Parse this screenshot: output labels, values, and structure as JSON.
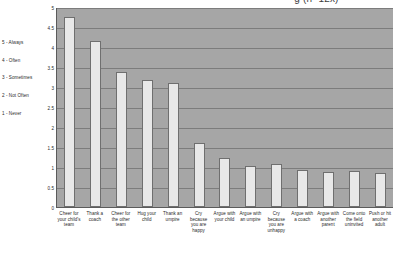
{
  "chart_data": {
    "type": "bar",
    "title": "g (n=12x)",
    "xlabel": "",
    "ylabel": "",
    "ylim": [
      0,
      5
    ],
    "grid": true,
    "legend_position": "left",
    "ytick_labels": [
      "5",
      "4.5",
      "4",
      "3.5",
      "3",
      "2.5",
      "2",
      "1.5",
      "1",
      "0.5",
      "0"
    ],
    "ytick_values": [
      5,
      4.5,
      4,
      3.5,
      3,
      2.5,
      2,
      1.5,
      1,
      0.5,
      0
    ],
    "legend": [
      "5 - Always",
      "4 - Often",
      "3 - Sometimes",
      "2 - Not Often",
      "1 - Never"
    ],
    "categories": [
      "Cheer for your child's team",
      "Thank a coach",
      "Cheer for the other team",
      "Hug your child",
      "Thank an umpire",
      "Cry because you are happy",
      "Argue with your child",
      "Argue with an umpire",
      "Cry because you are unhappy",
      "Argue with a coach",
      "Argue with another parent",
      "Come onto the field uninvited",
      "Push or hit another adult"
    ],
    "values": [
      4.75,
      4.15,
      3.38,
      3.18,
      3.1,
      1.6,
      1.22,
      1.03,
      1.08,
      0.92,
      0.88,
      0.9,
      0.85
    ]
  }
}
